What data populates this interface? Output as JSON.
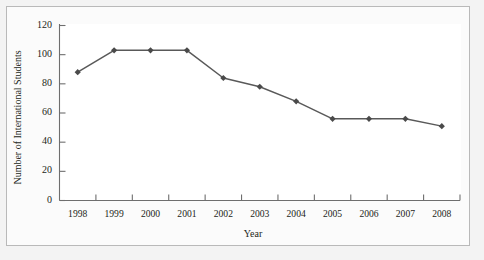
{
  "chart_data": {
    "type": "line",
    "title": "",
    "xlabel": "Year",
    "ylabel": "Number of International Students",
    "categories": [
      "1998",
      "1999",
      "2000",
      "2001",
      "2002",
      "2003",
      "2004",
      "2005",
      "2006",
      "2007",
      "2008"
    ],
    "values": [
      88,
      103,
      103,
      103,
      84,
      78,
      68,
      56,
      56,
      56,
      51
    ],
    "series": [
      {
        "name": "Number of International Students",
        "values": [
          88,
          103,
          103,
          103,
          84,
          78,
          68,
          56,
          56,
          56,
          51
        ]
      }
    ],
    "ylim": [
      0,
      120
    ],
    "yticks": [
      0,
      20,
      40,
      60,
      80,
      100,
      120
    ],
    "ytick_labels": [
      "0",
      "20",
      "40",
      "60",
      "80",
      "100",
      "120"
    ],
    "xtick_labels": [
      "1998",
      "1999",
      "2000",
      "2001",
      "2002",
      "2003",
      "2004",
      "2005",
      "2006",
      "2007",
      "2008"
    ],
    "grid": false,
    "legend": "none",
    "marker": "diamond",
    "line_color": "#595959",
    "marker_color": "#4a4a4a",
    "axis_color": "#6e6e6e",
    "text_color": "#231f20",
    "plot_background": "#ffffff",
    "frame_background": "#fbfbfb",
    "page_background": "#f3f3f3"
  }
}
